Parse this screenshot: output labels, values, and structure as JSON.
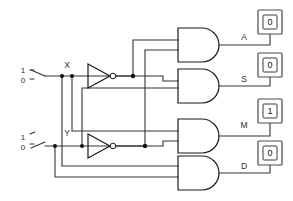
{
  "diagram": {
    "type": "logic-circuit-schematic",
    "colors": {
      "wire": "#333333",
      "gate_outline": "#1a1a1a",
      "background": "#ffffff",
      "lamp_border": "#4a4a4a",
      "text": "#2b2b2b"
    }
  },
  "inputs": [
    {
      "name": "X",
      "label": "X",
      "high_label": "1",
      "low_label": "0",
      "position": "top",
      "switch_state": "1",
      "icon": "spdt-switch-icon"
    },
    {
      "name": "Y",
      "label": "Y",
      "high_label": "1",
      "low_label": "0",
      "position": "bottom",
      "switch_state": "0",
      "icon": "spdt-switch-icon"
    }
  ],
  "inverters": [
    {
      "name": "not-x",
      "icon": "inverter-icon",
      "input": "X"
    },
    {
      "name": "not-y",
      "icon": "inverter-icon",
      "input": "Y"
    }
  ],
  "gates": [
    {
      "name": "and-gate-a",
      "icon": "and-gate-icon",
      "output": "A"
    },
    {
      "name": "and-gate-s",
      "icon": "and-gate-icon",
      "output": "S"
    },
    {
      "name": "and-gate-m",
      "icon": "and-gate-icon",
      "output": "M"
    },
    {
      "name": "and-gate-d",
      "icon": "and-gate-icon",
      "output": "D"
    }
  ],
  "outputs": [
    {
      "name": "A",
      "label": "A",
      "value": "0",
      "icon": "lamp-indicator-icon"
    },
    {
      "name": "S",
      "label": "S",
      "value": "0",
      "icon": "lamp-indicator-icon"
    },
    {
      "name": "M",
      "label": "M",
      "value": "1",
      "icon": "lamp-indicator-icon"
    },
    {
      "name": "D",
      "label": "D",
      "value": "0",
      "icon": "lamp-indicator-icon"
    }
  ]
}
